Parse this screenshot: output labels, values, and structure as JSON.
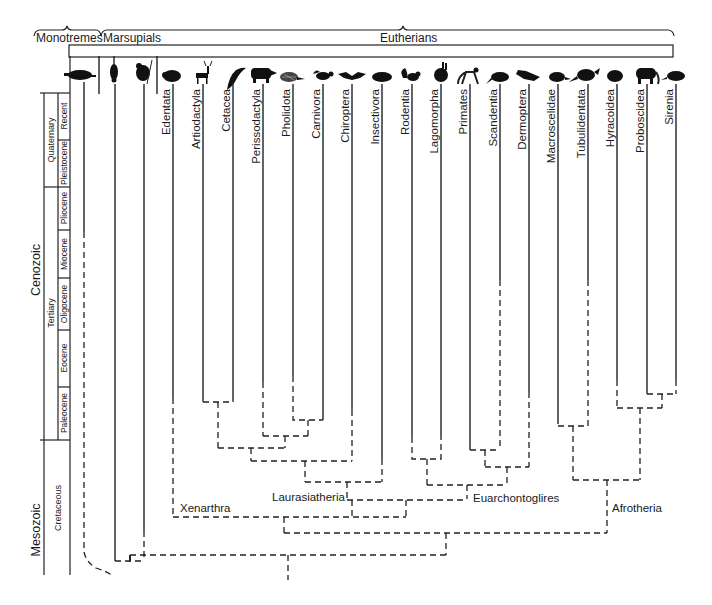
{
  "groups": {
    "monotremes": "Monotremes",
    "marsupials": "Marsupials",
    "eutherians": "Eutherians"
  },
  "timescale": {
    "eras": [
      "Cenozoic",
      "Mesozoic"
    ],
    "periods": [
      "Quaternary",
      "Tertiary",
      "Cretaceous"
    ],
    "epochs": [
      "Recent",
      "Pleistocene",
      "Pliocene",
      "Miocene",
      "Oligocene",
      "Eocene",
      "Paleocene"
    ]
  },
  "taxa": [
    {
      "name": "Edentata",
      "icon": "armadillo-icon"
    },
    {
      "name": "Artiodactyla",
      "icon": "deer-icon"
    },
    {
      "name": "Cetacea",
      "icon": "dolphin-icon"
    },
    {
      "name": "Perissodactyla",
      "icon": "rhinoceros-icon"
    },
    {
      "name": "Pholidota",
      "icon": "pangolin-icon"
    },
    {
      "name": "Carnivora",
      "icon": "skunk-icon"
    },
    {
      "name": "Chiroptera",
      "icon": "bat-icon"
    },
    {
      "name": "Insectivora",
      "icon": "mole-icon"
    },
    {
      "name": "Rodentia",
      "icon": "squirrel-icon"
    },
    {
      "name": "Lagomorpha",
      "icon": "rabbit-icon"
    },
    {
      "name": "Primates",
      "icon": "monkey-icon"
    },
    {
      "name": "Scandentia",
      "icon": "tree-shrew-icon"
    },
    {
      "name": "Dermoptera",
      "icon": "colugo-icon"
    },
    {
      "name": "Macroscelidae",
      "icon": "elephant-shrew-icon"
    },
    {
      "name": "Tubulidentata",
      "icon": "aardvark-icon"
    },
    {
      "name": "Hyracoidea",
      "icon": "hyrax-icon"
    },
    {
      "name": "Proboscidea",
      "icon": "elephant-icon"
    },
    {
      "name": "Sirenia",
      "icon": "manatee-icon"
    }
  ],
  "basal_icons": [
    "platypus-icon",
    "opossum-icon",
    "koala-icon"
  ],
  "clades": {
    "xenarthra": "Xenarthra",
    "laurasiatheria": "Laurasiatheria",
    "euarchontoglires": "Euarchontoglires",
    "afrotheria": "Afrotheria"
  }
}
